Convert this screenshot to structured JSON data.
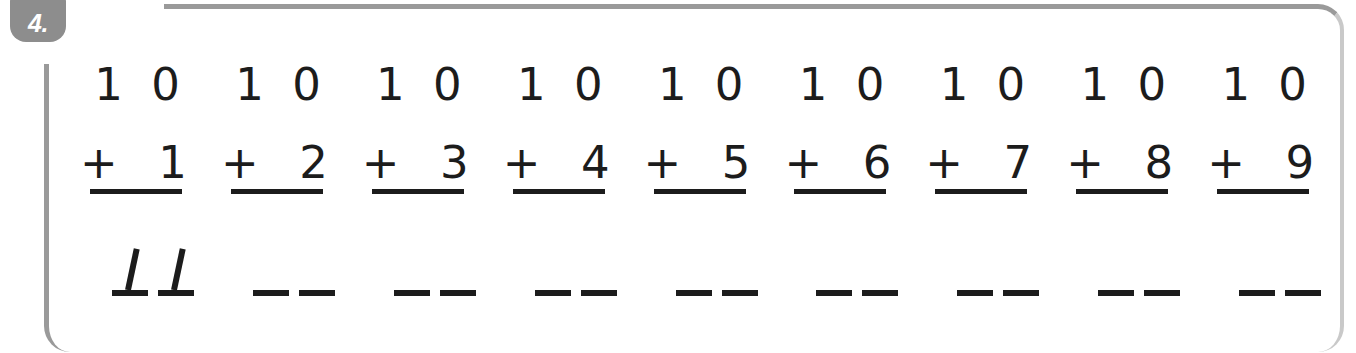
{
  "exercise": {
    "number_label": "4.",
    "accent_color": "#8d8d8d",
    "frame_color": "#9a9a9a",
    "ink_color": "#1c1c1c"
  },
  "problems": [
    {
      "top_addend": "1 0",
      "operator": "+",
      "bottom_addend": "1",
      "answer_blank_count": 2,
      "handwritten_answer": "11",
      "is_answered": true
    },
    {
      "top_addend": "1 0",
      "operator": "+",
      "bottom_addend": "2",
      "answer_blank_count": 2,
      "handwritten_answer": "",
      "is_answered": false
    },
    {
      "top_addend": "1 0",
      "operator": "+",
      "bottom_addend": "3",
      "answer_blank_count": 2,
      "handwritten_answer": "",
      "is_answered": false
    },
    {
      "top_addend": "1 0",
      "operator": "+",
      "bottom_addend": "4",
      "answer_blank_count": 2,
      "handwritten_answer": "",
      "is_answered": false
    },
    {
      "top_addend": "1 0",
      "operator": "+",
      "bottom_addend": "5",
      "answer_blank_count": 2,
      "handwritten_answer": "",
      "is_answered": false
    },
    {
      "top_addend": "1 0",
      "operator": "+",
      "bottom_addend": "6",
      "answer_blank_count": 2,
      "handwritten_answer": "",
      "is_answered": false
    },
    {
      "top_addend": "1 0",
      "operator": "+",
      "bottom_addend": "7",
      "answer_blank_count": 2,
      "handwritten_answer": "",
      "is_answered": false
    },
    {
      "top_addend": "1 0",
      "operator": "+",
      "bottom_addend": "8",
      "answer_blank_count": 2,
      "handwritten_answer": "",
      "is_answered": false
    },
    {
      "top_addend": "1 0",
      "operator": "+",
      "bottom_addend": "9",
      "answer_blank_count": 2,
      "handwritten_answer": "",
      "is_answered": false
    }
  ]
}
